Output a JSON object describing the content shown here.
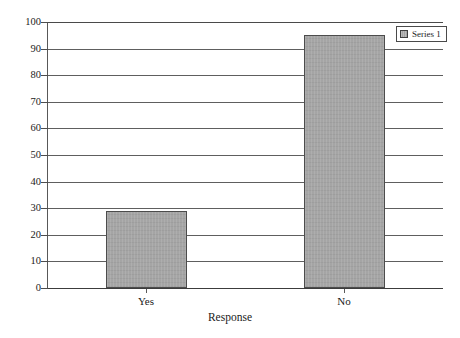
{
  "chart_data": {
    "type": "bar",
    "title": "",
    "categories": [
      "Yes",
      "No"
    ],
    "series": [
      {
        "name": "Series 1",
        "values": [
          29,
          95
        ]
      }
    ],
    "xlabel": "Response",
    "ylabel": "",
    "ylim": [
      0,
      100
    ],
    "ytick_step": 10,
    "yticks": [
      "0",
      "10",
      "20",
      "30",
      "40",
      "50",
      "60",
      "70",
      "80",
      "90",
      "100"
    ],
    "grid": "horizontal",
    "legend_position": "top-right",
    "bar_color": "#a3a3a3",
    "bar_border_color": "#4c4c4c",
    "gridline_color": "#5e5e5e",
    "axis_color": "#3c3c3c"
  },
  "legend": {
    "entries": [
      {
        "label": "Series 1",
        "color": "#a3a3a3"
      }
    ]
  },
  "axes": {
    "x_title": "Response",
    "x_categories": [
      "Yes",
      "No"
    ],
    "y_labels": [
      "100",
      "90",
      "80",
      "70",
      "60",
      "50",
      "40",
      "30",
      "20",
      "10",
      "0"
    ]
  },
  "title_remnant": ""
}
